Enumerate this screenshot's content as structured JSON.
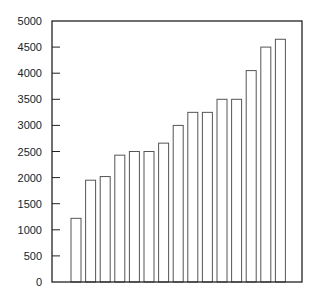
{
  "chart_data": {
    "type": "bar",
    "title": "",
    "xlabel": "",
    "ylabel": "",
    "categories": [
      "1",
      "2",
      "3",
      "4",
      "5",
      "6",
      "7",
      "8",
      "9",
      "10",
      "11",
      "12",
      "13",
      "14",
      "15"
    ],
    "values": [
      1220,
      1950,
      2020,
      2430,
      2500,
      2500,
      2660,
      3000,
      3250,
      3250,
      3500,
      3500,
      4050,
      4500,
      4650
    ],
    "ylim": [
      0,
      5000
    ],
    "yticks": [
      0,
      500,
      1000,
      1500,
      2000,
      2500,
      3000,
      3500,
      4000,
      4500,
      5000
    ],
    "ytick_labels": [
      "0",
      "500",
      "1000",
      "1500",
      "2000",
      "2500",
      "3000",
      "3500",
      "4000",
      "4500",
      "5000"
    ],
    "xtick_labels": [],
    "grid": false,
    "legend": null,
    "bar_fill": "#ffffff",
    "bar_stroke": "#555555",
    "axis_color": "#222222"
  }
}
